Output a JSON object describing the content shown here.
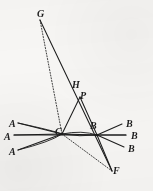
{
  "figure": {
    "background_color": "#f7f6f4",
    "ink_color": "#1d1d1d",
    "width": 153,
    "height": 191
  },
  "labels": [
    {
      "id": "label-G",
      "text": "G",
      "x": 37,
      "y": 9
    },
    {
      "id": "label-H",
      "text": "H",
      "x": 72,
      "y": 80
    },
    {
      "id": "label-P",
      "text": "P",
      "x": 80,
      "y": 91
    },
    {
      "id": "label-A1",
      "text": "A",
      "x": 9,
      "y": 119
    },
    {
      "id": "label-A2",
      "text": "A",
      "x": 4,
      "y": 132
    },
    {
      "id": "label-A3",
      "text": "A",
      "x": 9,
      "y": 147
    },
    {
      "id": "label-Bc",
      "text": "B",
      "x": 90,
      "y": 121
    },
    {
      "id": "label-B1",
      "text": "B",
      "x": 126,
      "y": 119
    },
    {
      "id": "label-B2",
      "text": "B",
      "x": 131,
      "y": 131
    },
    {
      "id": "label-B3",
      "text": "B",
      "x": 128,
      "y": 144
    },
    {
      "id": "label-C",
      "text": "C",
      "x": 55,
      "y": 127
    },
    {
      "id": "label-F",
      "text": "F",
      "x": 113,
      "y": 166
    }
  ],
  "points": {
    "G": {
      "x": 40,
      "y": 20
    },
    "H": {
      "x": 78,
      "y": 90
    },
    "P": {
      "x": 80,
      "y": 97
    },
    "C": {
      "x": 62,
      "y": 134
    },
    "B": {
      "x": 97,
      "y": 135
    },
    "F": {
      "x": 112,
      "y": 171
    },
    "A1": {
      "x": 18,
      "y": 123
    },
    "A2": {
      "x": 14,
      "y": 135
    },
    "A3": {
      "x": 18,
      "y": 150
    },
    "B1": {
      "x": 122,
      "y": 124
    },
    "B2": {
      "x": 126,
      "y": 135
    },
    "B3": {
      "x": 124,
      "y": 147
    }
  },
  "segments": [
    {
      "id": "seg-G-F",
      "from": "G",
      "to": "F",
      "style": "solid",
      "note": "main ray G through H and P to F"
    },
    {
      "id": "seg-G-C",
      "from": "G",
      "to": "C",
      "style": "dotted",
      "note": "dotted ray G to C"
    },
    {
      "id": "seg-C-P",
      "from": "C",
      "to": "P",
      "style": "solid",
      "note": "side C to P"
    },
    {
      "id": "seg-C-B",
      "from": "C",
      "to": "B",
      "style": "solid",
      "note": "base C to B"
    },
    {
      "id": "seg-P-B",
      "from": "P",
      "to": "B",
      "style": "solid",
      "note": "side P to B"
    },
    {
      "id": "seg-B-F",
      "from": "B",
      "to": "F",
      "style": "solid",
      "note": "ray B to F"
    },
    {
      "id": "seg-C-F",
      "from": "C",
      "to": "F",
      "style": "dotted",
      "note": "dotted ray C to F"
    },
    {
      "id": "seg-A1-C",
      "from": "A1",
      "to": "C",
      "style": "solid",
      "note": "upper A ray into C"
    },
    {
      "id": "seg-A2-C",
      "from": "A2",
      "to": "C",
      "style": "solid",
      "note": "middle A ray into C"
    },
    {
      "id": "seg-A3-C",
      "from": "A3",
      "to": "C",
      "style": "solid",
      "note": "lower A ray into C"
    },
    {
      "id": "seg-B-B1",
      "from": "B",
      "to": "B1",
      "style": "solid",
      "note": "upper B ray out of B"
    },
    {
      "id": "seg-B-B2",
      "from": "B",
      "to": "B2",
      "style": "solid",
      "note": "middle B ray out of B"
    },
    {
      "id": "seg-B-B3",
      "from": "B",
      "to": "B3",
      "style": "solid",
      "note": "lower B ray out of B"
    },
    {
      "id": "seg-A2-B2",
      "from": "A2",
      "to": "B2",
      "style": "solid",
      "note": "horizontal axis line A through C and B"
    }
  ],
  "arcs": [
    {
      "id": "arc-upper",
      "style": "solid",
      "note": "wavefront arc curving from upper left through C region to B"
    },
    {
      "id": "arc-lower",
      "style": "solid",
      "note": "wavefront arc curving from lower left through C region to B"
    }
  ]
}
